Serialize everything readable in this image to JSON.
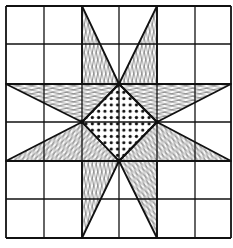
{
  "diagram": {
    "title": "",
    "type": "quilt-block-eight-point-star",
    "grid": {
      "columns": 6,
      "rows": 6,
      "x_lines": [
        6,
        44,
        82,
        119,
        157,
        195,
        231
      ],
      "y_lines": [
        6,
        44,
        84,
        122,
        161,
        199,
        238
      ]
    },
    "center_diamond": {
      "fill": "dots",
      "points": [
        [
          119,
          84
        ],
        [
          157,
          122
        ],
        [
          119,
          161
        ],
        [
          82,
          122
        ]
      ]
    },
    "star_points": [
      {
        "name": "top-left",
        "fill": "grain-vertical",
        "points": [
          [
            82,
            6
          ],
          [
            119,
            84
          ],
          [
            82,
            84
          ]
        ]
      },
      {
        "name": "top-right",
        "fill": "grain-vertical",
        "points": [
          [
            157,
            6
          ],
          [
            157,
            84
          ],
          [
            119,
            84
          ]
        ]
      },
      {
        "name": "right-top",
        "fill": "grain-horizontal",
        "points": [
          [
            231,
            84
          ],
          [
            157,
            122
          ],
          [
            119,
            84
          ]
        ]
      },
      {
        "name": "right-bottom",
        "fill": "grain-diagonal-b",
        "points": [
          [
            231,
            161
          ],
          [
            119,
            161
          ],
          [
            157,
            122
          ]
        ]
      },
      {
        "name": "bottom-right",
        "fill": "grain-diagonal-b",
        "points": [
          [
            157,
            238
          ],
          [
            119,
            161
          ],
          [
            157,
            161
          ]
        ]
      },
      {
        "name": "bottom-left",
        "fill": "grain-vertical",
        "points": [
          [
            82,
            238
          ],
          [
            82,
            161
          ],
          [
            119,
            161
          ]
        ]
      },
      {
        "name": "left-bottom",
        "fill": "grain-diagonal-a",
        "points": [
          [
            6,
            161
          ],
          [
            82,
            122
          ],
          [
            119,
            161
          ]
        ]
      },
      {
        "name": "left-top",
        "fill": "grain-horizontal",
        "points": [
          [
            6,
            84
          ],
          [
            119,
            84
          ],
          [
            82,
            122
          ]
        ]
      }
    ],
    "colors": {
      "background": "#ffffff",
      "ink": "#111111"
    }
  }
}
